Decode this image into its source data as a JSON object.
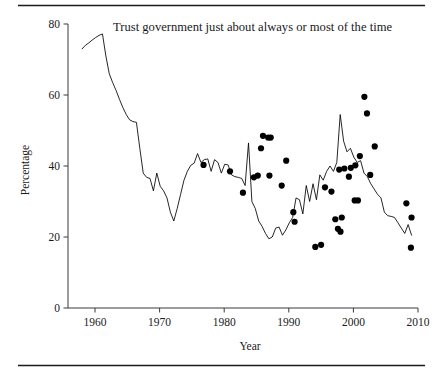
{
  "figure": {
    "title": "Trust government just about always or most of the time",
    "top_rule": true,
    "bottom_rule": true
  },
  "chart_data": {
    "type": "line",
    "title": "Trust government just about always or most of the time",
    "xlabel": "Year",
    "ylabel": "Percentage",
    "xlim": [
      1956,
      2010
    ],
    "ylim": [
      0,
      80
    ],
    "xticks": [
      1960,
      1970,
      1980,
      1990,
      2000,
      2010
    ],
    "xticklabels": [
      "1960",
      "1970",
      "1980",
      "1990",
      "2000",
      "2010"
    ],
    "yticks": [
      0,
      20,
      40,
      60,
      80
    ],
    "yticklabels": [
      "0",
      "20",
      "40",
      "60",
      "80"
    ],
    "grid": false,
    "legend": "none",
    "series": [
      {
        "name": "Trust in government (trend line)",
        "style": "line",
        "color": "#000000",
        "points": [
          [
            1958,
            73.0
          ],
          [
            1959,
            74.0
          ],
          [
            1960,
            74.7
          ],
          [
            1961,
            75.5
          ],
          [
            1962,
            76.2
          ],
          [
            1963,
            76.8
          ],
          [
            1964,
            77.2
          ],
          [
            1965,
            71.0
          ],
          [
            1966,
            66.0
          ],
          [
            1967,
            63.5
          ],
          [
            1968,
            61.3
          ],
          [
            1969,
            58.8
          ],
          [
            1970,
            56.5
          ],
          [
            1971,
            54.5
          ],
          [
            1972,
            53.0
          ],
          [
            1973,
            52.5
          ],
          [
            1974,
            52.3
          ],
          [
            1975,
            45.0
          ],
          [
            1976,
            38.0
          ],
          [
            1977,
            36.8
          ],
          [
            1978,
            36.5
          ],
          [
            1979,
            33.0
          ],
          [
            1980,
            38.0
          ],
          [
            1981,
            34.3
          ],
          [
            1982,
            33.0
          ],
          [
            1983,
            31.0
          ],
          [
            1984,
            27.0
          ],
          [
            1985,
            24.5
          ],
          [
            1986,
            28.0
          ],
          [
            1987,
            32.0
          ],
          [
            1988,
            36.0
          ],
          [
            1989,
            38.5
          ],
          [
            1990,
            40.2
          ],
          [
            1991,
            40.8
          ],
          [
            1992,
            43.5
          ],
          [
            1993,
            41.0
          ],
          [
            1994,
            41.8
          ],
          [
            1995,
            42.0
          ],
          [
            1996,
            38.5
          ],
          [
            1997,
            41.8
          ],
          [
            1998,
            41.0
          ],
          [
            1999,
            38.0
          ],
          [
            2000,
            40.5
          ],
          [
            2001,
            40.3
          ],
          [
            2002,
            37.5
          ],
          [
            2003,
            37.0
          ],
          [
            2004,
            36.8
          ],
          [
            2005,
            36.5
          ],
          [
            2006,
            34.5
          ],
          [
            2007,
            46.5
          ],
          [
            2008,
            30.0
          ],
          [
            2009,
            28.0
          ],
          [
            2010,
            24.5
          ],
          [
            2011,
            23.0
          ],
          [
            2012,
            21.0
          ],
          [
            2013,
            19.5
          ],
          [
            2014,
            20.0
          ],
          [
            2015,
            22.5
          ],
          [
            2016,
            22.8
          ],
          [
            2017,
            20.5
          ],
          [
            2018,
            22.0
          ],
          [
            2019,
            24.0
          ],
          [
            2020,
            25.5
          ],
          [
            2021,
            31.0
          ],
          [
            2022,
            30.5
          ],
          [
            2023,
            26.5
          ],
          [
            2024,
            34.5
          ],
          [
            2025,
            30.0
          ],
          [
            2026,
            35.0
          ],
          [
            2027,
            30.5
          ],
          [
            2028,
            37.5
          ],
          [
            2029,
            36.0
          ],
          [
            2030,
            38.5
          ],
          [
            2031,
            40.0
          ],
          [
            2032,
            38.5
          ],
          [
            2033,
            41.0
          ],
          [
            2034,
            54.5
          ],
          [
            2035,
            47.0
          ],
          [
            2036,
            44.0
          ],
          [
            2037,
            45.0
          ],
          [
            2038,
            42.5
          ],
          [
            2039,
            41.0
          ],
          [
            2040,
            41.5
          ],
          [
            2041,
            38.0
          ],
          [
            2042,
            37.0
          ],
          [
            2043,
            35.0
          ],
          [
            2044,
            33.5
          ],
          [
            2045,
            32.0
          ],
          [
            2046,
            31.0
          ],
          [
            2047,
            27.0
          ],
          [
            2048,
            26.0
          ],
          [
            2049,
            25.8
          ],
          [
            2050,
            25.5
          ],
          [
            2051,
            24.0
          ],
          [
            2052,
            22.5
          ],
          [
            2053,
            21.0
          ],
          [
            2054,
            23.5
          ],
          [
            2055,
            20.5
          ]
        ]
      }
    ],
    "scatter_points": [
      [
        1976.8,
        40.3
      ],
      [
        1980.9,
        38.5
      ],
      [
        1982.9,
        32.5
      ],
      [
        1984.6,
        36.8
      ],
      [
        1985.2,
        37.3
      ],
      [
        1985.7,
        45.0
      ],
      [
        1986.0,
        48.5
      ],
      [
        1986.8,
        48.0
      ],
      [
        1987.2,
        48.0
      ],
      [
        1987.0,
        37.3
      ],
      [
        1988.9,
        34.5
      ],
      [
        1989.6,
        41.5
      ],
      [
        1990.7,
        27.0
      ],
      [
        1990.9,
        24.3
      ],
      [
        1994.1,
        17.2
      ],
      [
        1995.0,
        17.8
      ],
      [
        1995.6,
        34.0
      ],
      [
        1996.6,
        32.8
      ],
      [
        1997.2,
        25.0
      ],
      [
        1997.6,
        22.3
      ],
      [
        1998.0,
        21.5
      ],
      [
        1998.2,
        25.5
      ],
      [
        1997.8,
        39.0
      ],
      [
        1998.6,
        39.3
      ],
      [
        1999.3,
        37.0
      ],
      [
        1999.6,
        39.5
      ],
      [
        2000.2,
        30.3
      ],
      [
        2000.7,
        30.3
      ],
      [
        2000.3,
        40.2
      ],
      [
        2001.0,
        42.8
      ],
      [
        2001.7,
        59.5
      ],
      [
        2002.1,
        54.8
      ],
      [
        2002.6,
        37.5
      ],
      [
        2003.3,
        45.5
      ],
      [
        2008.2,
        29.5
      ],
      [
        2009.0,
        25.5
      ],
      [
        2008.9,
        17.0
      ]
    ]
  },
  "axes": {
    "y_label": "Percentage",
    "x_label": "Year"
  }
}
